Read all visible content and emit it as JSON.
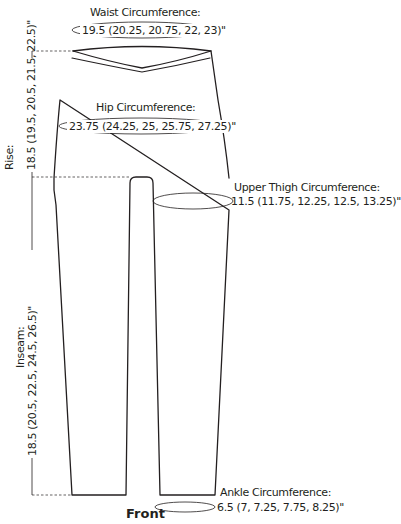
{
  "diagram": {
    "view_label": "Front",
    "stroke_color": "#231f20",
    "measurements": {
      "waist": {
        "label": "Waist Circumference:",
        "value": "19.5 (20.25, 20.75, 22, 23)\""
      },
      "hip": {
        "label": "Hip Circumference:",
        "value": "23.75 (24.25, 25, 25.75, 27.25)\""
      },
      "upper_thigh": {
        "label": "Upper Thigh Circumference:",
        "value": "11.5 (11.75, 12.25, 12.5, 13.25)\""
      },
      "ankle": {
        "label": "Ankle Circumference:",
        "value": "6.5 (7, 7.25, 7.75, 8.25)\""
      },
      "rise": {
        "label": "Rise:",
        "value": "18.5 (19.5, 20.5, 21.5, 22.5)\""
      },
      "inseam": {
        "label": "Inseam:",
        "value": "18.5 (20.5, 22.5, 24.5, 26.5)\""
      }
    }
  }
}
